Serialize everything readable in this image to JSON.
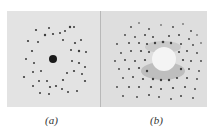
{
  "figure": {
    "panels": [
      {
        "id": "a",
        "label": "(a)",
        "description": "Laue diffraction pattern with sparse spots around central dark beam spot"
      },
      {
        "id": "b",
        "label": "(b)",
        "description": "Laue diffraction pattern with dense spots surrounding a bright central region"
      }
    ],
    "captions": {
      "a": "(a)",
      "b": "(b)"
    }
  }
}
